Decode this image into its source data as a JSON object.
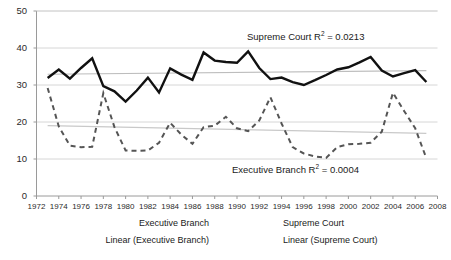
{
  "chart_data": {
    "type": "line",
    "title": "",
    "xlabel": "",
    "ylabel": "",
    "xlim": [
      1972,
      2008
    ],
    "ylim": [
      0,
      50
    ],
    "grid": true,
    "legend_position": "bottom",
    "y_ticks": [
      0,
      10,
      20,
      30,
      40,
      50
    ],
    "x_ticks": [
      1972,
      1974,
      1976,
      1978,
      1980,
      1982,
      1984,
      1986,
      1988,
      1990,
      1992,
      1994,
      1996,
      1998,
      2000,
      2002,
      2004,
      2006,
      2008
    ],
    "x": [
      1973,
      1974,
      1975,
      1976,
      1977,
      1978,
      1979,
      1980,
      1981,
      1982,
      1983,
      1984,
      1985,
      1986,
      1987,
      1988,
      1989,
      1990,
      1991,
      1992,
      1993,
      1994,
      1995,
      1996,
      1997,
      1998,
      1999,
      2000,
      2001,
      2002,
      2003,
      2004,
      2005,
      2006,
      2007
    ],
    "series": [
      {
        "name": "Executive Branch",
        "style": "dashed",
        "color": "#555555",
        "values": [
          29.2,
          18.8,
          13.6,
          13.2,
          13.3,
          27.8,
          18.6,
          12.3,
          12.2,
          12.3,
          14.4,
          19.8,
          16.6,
          14.1,
          18.6,
          19.0,
          21.4,
          18.3,
          17.5,
          20.4,
          26.7,
          19.6,
          13.2,
          11.5,
          10.7,
          10.3,
          13.2,
          14.0,
          14.1,
          14.4,
          17.4,
          27.9,
          23.0,
          18.3,
          10.2
        ]
      },
      {
        "name": "Supreme Court",
        "style": "solid",
        "color": "#111111",
        "values": [
          31.9,
          34.2,
          31.7,
          34.6,
          37.2,
          29.7,
          28.3,
          25.5,
          28.5,
          32.0,
          28.0,
          34.5,
          32.8,
          31.4,
          38.8,
          36.6,
          36.2,
          36.0,
          39.1,
          34.6,
          31.6,
          32.0,
          30.8,
          30.0,
          31.3,
          32.7,
          34.2,
          34.8,
          36.1,
          37.6,
          33.9,
          32.3,
          33.2,
          34.0,
          30.8
        ]
      }
    ],
    "trendlines": [
      {
        "name": "Linear (Executive Branch)",
        "color": "#c9c9c9",
        "style": "solid-thin",
        "y_start": 19.0,
        "y_end": 16.9,
        "r_squared": "0.0004"
      },
      {
        "name": "Linear (Supreme Court)",
        "color": "#bdbdbd",
        "style": "solid-thin",
        "y_start": 32.9,
        "y_end": 33.9,
        "r_squared": "0.0213"
      }
    ],
    "annotations": [
      {
        "id": "supreme-court-r2",
        "text_prefix": "Supreme Court R",
        "text_sup": "2",
        "text_suffix": " = 0.0213",
        "x_px": 247,
        "y_px": 31
      },
      {
        "id": "executive-branch-r2",
        "text_prefix": "Executive Branch R",
        "text_sup": "2",
        "text_suffix": " = 0.0004",
        "x_px": 232,
        "y_px": 164
      }
    ]
  },
  "axes": {
    "y_labels": [
      "50",
      "40",
      "30",
      "20",
      "10",
      "0"
    ],
    "x_labels": [
      "1972",
      "1974",
      "1976",
      "1978",
      "1980",
      "1982",
      "1984",
      "1986",
      "1988",
      "1990",
      "1992",
      "1994",
      "1996",
      "1998",
      "2000",
      "2002",
      "2004",
      "2006",
      "2008"
    ]
  },
  "legend": {
    "items": [
      {
        "label": "Executive Branch",
        "key": "dashed-key-icon"
      },
      {
        "label": "Supreme Court",
        "key": "solid-key-icon"
      },
      {
        "label": "Linear (Executive Branch)",
        "key": "thin-line-key-icon"
      },
      {
        "label": "Linear (Supreme Court)",
        "key": "thin-line-key-icon"
      }
    ]
  },
  "colors": {
    "executive": "#555555",
    "supreme": "#111111",
    "gridline": "#d6d6d6",
    "trend_exec": "#c9c9c9",
    "trend_sup": "#bdbdbd",
    "axis": "#9a9a9a",
    "text": "#1a1a1a"
  }
}
